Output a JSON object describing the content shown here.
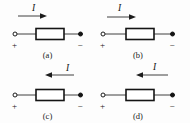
{
  "figure": {
    "name": "four-panel-circuit-element-current-direction-figure",
    "background_color": "#fdfdfd",
    "line_color": "#2b2b2b",
    "element_border_color": "#141414"
  },
  "panels": [
    {
      "caption": "(a)",
      "current_label": "I",
      "current_direction": "right",
      "label_position": "above-left-of-arrowhead",
      "arrow_horizontal_position": "left",
      "left_terminal": {
        "type": "open-circle",
        "sign": "+"
      },
      "right_terminal": {
        "type": "filled-circle",
        "sign": "−"
      },
      "element": "resistor-box"
    },
    {
      "caption": "(b)",
      "current_label": "I",
      "current_direction": "right",
      "label_position": "above-arrow-center",
      "arrow_horizontal_position": "left",
      "left_terminal": {
        "type": "open-circle",
        "sign": "+"
      },
      "right_terminal": {
        "type": "filled-circle",
        "sign": "−"
      },
      "element": "resistor-box"
    },
    {
      "caption": "(c)",
      "current_label": "I",
      "current_direction": "left",
      "label_position": "right-of-arrow",
      "arrow_horizontal_position": "right",
      "left_terminal": {
        "type": "open-circle",
        "sign": "+"
      },
      "right_terminal": {
        "type": "filled-circle",
        "sign": "−"
      },
      "element": "resistor-box"
    },
    {
      "caption": "(d)",
      "current_label": "I",
      "current_direction": "left",
      "label_position": "above-arrow-center",
      "arrow_horizontal_position": "right",
      "left_terminal": {
        "type": "open-circle",
        "sign": "+"
      },
      "right_terminal": {
        "type": "filled-circle",
        "sign": "−"
      },
      "element": "resistor-box"
    }
  ]
}
